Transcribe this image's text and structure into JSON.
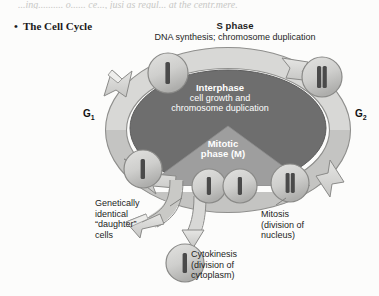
{
  "page": {
    "top_cut_text": "...ing.......... o...... ce..., jusi as regul... at the centr.mere.",
    "background_color": "#fcfcfb"
  },
  "heading": {
    "bullet": "•",
    "label": "The Cell Cycle"
  },
  "diagram": {
    "title": "The Cell Cycle",
    "s_phase": {
      "title": "S phase",
      "subtitle": "DNA synthesis; chromosome duplication"
    },
    "interphase": {
      "line1": "Interphase",
      "line2": "cell growth and",
      "line3": "chromosome duplication"
    },
    "mitotic_phase": {
      "line1": "Mitotic",
      "line2": "phase (M)"
    },
    "gap_phases": {
      "g1": "G",
      "g1_sub": "1",
      "g2": "G",
      "g2_sub": "2"
    },
    "daughter_cells": {
      "line1": "Genetically",
      "line2": "identical",
      "line3": "“daughter”",
      "line4": "cells"
    },
    "mitosis": {
      "line1": "Mitosis",
      "line2": "(division of",
      "line3": "nucleus)"
    },
    "cytokinesis": {
      "line1": "Cytokinesis",
      "line2": "(division of",
      "line3": "cytoplasm)"
    },
    "colors": {
      "interphase_fill": "#6e6e6e",
      "mitotic_fill": "#9e9e9e",
      "arrow_fill": "#d8d8d6",
      "arrow_shade": "#b4b4b2",
      "cell_fill": "#cfcfcd",
      "cell_stroke": "#8a8a88",
      "chromosome": "#4a4a4a",
      "text_dark": "#1d1d1d",
      "text_light": "#ffffff"
    },
    "cells": [
      {
        "name": "cell-g1-top",
        "chromosome": "single"
      },
      {
        "name": "cell-g2-top-right",
        "chromosome": "duplicated"
      },
      {
        "name": "cell-mitosis-right",
        "chromosome": "duplicated"
      },
      {
        "name": "cell-g1-left",
        "chromosome": "single"
      },
      {
        "name": "cell-division-a",
        "chromosome": "single"
      },
      {
        "name": "cell-division-b",
        "chromosome": "single"
      },
      {
        "name": "cell-daughter-bottom",
        "chromosome": "single"
      }
    ]
  }
}
